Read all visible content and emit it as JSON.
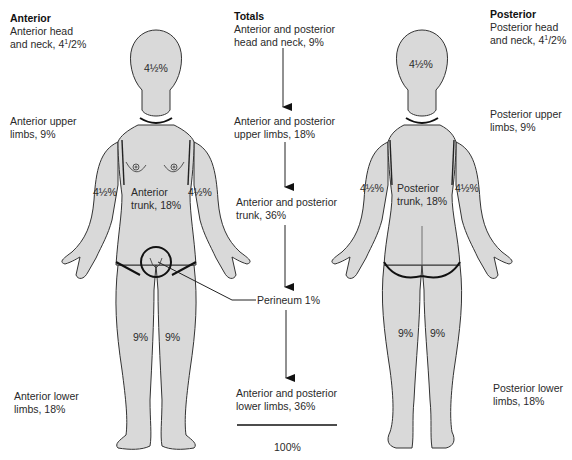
{
  "anterior": {
    "heading": "Anterior",
    "head_neck_line1": "Anterior head",
    "head_neck_line2": "and neck, 4",
    "head_neck_frac_num": "1",
    "head_neck_frac_den": "/2%",
    "upper_limbs_line1": "Anterior upper",
    "upper_limbs_line2": "limbs, 9%",
    "lower_limbs_line1": "Anterior lower",
    "lower_limbs_line2": "limbs, 18%",
    "figure": {
      "head_pct": "4½%",
      "left_arm_pct": "4½%",
      "right_arm_pct": "4½%",
      "trunk_line1": "Anterior",
      "trunk_line2": "trunk, 18%",
      "left_leg_pct": "9%",
      "right_leg_pct": "9%"
    }
  },
  "totals": {
    "heading": "Totals",
    "head_neck_line1": "Anterior and posterior",
    "head_neck_line2": "head and neck, 9%",
    "upper_limbs_line1": "Anterior and posterior",
    "upper_limbs_line2": "upper limbs, 18%",
    "trunk_line1": "Anterior and posterior",
    "trunk_line2": "trunk, 36%",
    "perineum": "Perineum 1%",
    "lower_limbs_line1": "Anterior and posterior",
    "lower_limbs_line2": "lower limbs, 36%",
    "sum": "100%"
  },
  "posterior": {
    "heading": "Posterior",
    "head_neck_line1": "Posterior head",
    "head_neck_line2": "and neck, 4",
    "head_neck_frac_num": "1",
    "head_neck_frac_den": "/2%",
    "upper_limbs_line1": "Posterior upper",
    "upper_limbs_line2": "limbs, 9%",
    "lower_limbs_line1": "Posterior lower",
    "lower_limbs_line2": "limbs, 18%",
    "figure": {
      "head_pct": "4½%",
      "left_arm_pct": "4½%",
      "right_arm_pct": "4½%",
      "trunk_line1": "Posterior",
      "trunk_line2": "trunk, 18%",
      "left_leg_pct": "9%",
      "right_leg_pct": "9%"
    }
  },
  "colors": {
    "body_fill": "#d9d9d9",
    "outline": "#333333",
    "region_line": "#111111"
  }
}
